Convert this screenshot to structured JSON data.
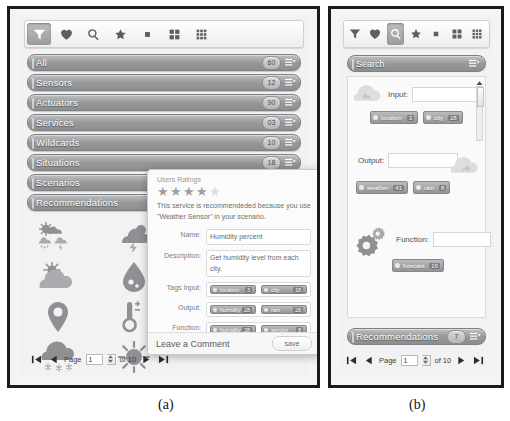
{
  "figure": {
    "caption_a": "(a)",
    "caption_b": "(b)"
  },
  "toolbar": {
    "items": [
      {
        "icon": "funnel-icon",
        "name": "filter-button",
        "selected_a": true,
        "selected_b": false
      },
      {
        "icon": "heart-icon",
        "name": "favorites-button",
        "selected_a": false,
        "selected_b": false
      },
      {
        "icon": "search-icon",
        "name": "search-button",
        "selected_a": false,
        "selected_b": true
      },
      {
        "icon": "star-icon",
        "name": "rating-button",
        "selected_a": false,
        "selected_b": false
      },
      {
        "icon": "square-icon",
        "name": "single-view-button",
        "selected_a": false,
        "selected_b": false
      },
      {
        "icon": "grid-2x2-icon",
        "name": "grid-2x2-button",
        "selected_a": false,
        "selected_b": false
      },
      {
        "icon": "grid-3x3-icon",
        "name": "grid-3x3-button",
        "selected_a": false,
        "selected_b": false
      }
    ]
  },
  "panel_a": {
    "categories": [
      {
        "label": "All",
        "count": "60"
      },
      {
        "label": "Sensors",
        "count": "12"
      },
      {
        "label": "Actuators",
        "count": "90"
      },
      {
        "label": "Services",
        "count": "03"
      },
      {
        "label": "Wildcards",
        "count": "10"
      },
      {
        "label": "Situations",
        "count": "18"
      },
      {
        "label": "Scenarios",
        "count": "9"
      },
      {
        "label": "Recommendations",
        "count": "7"
      }
    ],
    "weather_icons": [
      "weather-collage-icon",
      "thunderstorm-cloud-icon",
      "sun-behind-cloud-icon",
      "water-drop-icon",
      "location-pin-icon",
      "thermometer-icon",
      "snow-cloud-icon",
      "sun-icon"
    ],
    "pager": {
      "first_label": "first-page",
      "prev_label": "previous-page",
      "page_label": "Page",
      "page_value": "1",
      "of_label": "of 10",
      "next_label": "next-page",
      "last_label": "last-page"
    }
  },
  "dialog": {
    "ratings_title": "Users Ratings",
    "stars_filled": 4,
    "stars_total": 5,
    "description": "This service is recommendeded because you use \"Weather Sensor\" in your scenario.",
    "fields": [
      {
        "label": "Name:",
        "value": "Humidity percent"
      },
      {
        "label": "Description:",
        "value": "Get humidity level from each city."
      }
    ],
    "tag_rows": [
      {
        "label": "Tags Input:",
        "chips": [
          {
            "text": "location",
            "count": "3"
          },
          {
            "text": "city",
            "count": "18"
          }
        ]
      },
      {
        "label": "Output:",
        "chips": [
          {
            "text": "humidity",
            "count": "28"
          },
          {
            "text": "rain",
            "count": "28"
          }
        ]
      },
      {
        "label": "Function:",
        "chips": [
          {
            "text": "humidity",
            "count": "28"
          },
          {
            "text": "service",
            "count": "8"
          }
        ]
      }
    ],
    "comment_label": "Leave a Comment",
    "save_label": "save"
  },
  "panel_b": {
    "header": "Search",
    "input_label": "Input:",
    "input_value": "",
    "input_chips": [
      {
        "text": "location",
        "count": "3"
      },
      {
        "text": "city",
        "count": "18"
      }
    ],
    "output_label": "Output:",
    "output_value": "",
    "output_chips": [
      {
        "text": "weather",
        "count": "41"
      },
      {
        "text": "rain",
        "count": "8"
      }
    ],
    "function_label": "Function:",
    "function_value": "",
    "function_chips": [
      {
        "text": "forecast",
        "count": "16"
      }
    ],
    "recommendations": {
      "label": "Recommendations",
      "count": "7"
    },
    "pager": {
      "page_label": "Page",
      "page_value": "1",
      "of_label": "of 10"
    }
  },
  "colors": {
    "chrome_gray": "#96989a",
    "bar_border": "#7e8082",
    "frame_black": "#1b1b1b",
    "icon_gray": "#8e9093",
    "text_white": "#ffffff"
  }
}
